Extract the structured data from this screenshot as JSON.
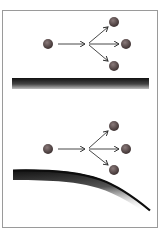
{
  "colors": {
    "frame_border": "#9a9a9a",
    "ball_light": "#8a7a7a",
    "ball_dark": "#3e3232",
    "arrow": "#333333",
    "surface": "#1a1a1a"
  },
  "panels": [
    {
      "name": "flat-surface-scattering",
      "incident_ball": {
        "cx": 48,
        "cy": 44
      },
      "split_point": {
        "x": 87,
        "y": 44
      },
      "scattered_balls": [
        {
          "cx": 114,
          "cy": 22
        },
        {
          "cx": 126,
          "cy": 44
        },
        {
          "cx": 114,
          "cy": 66
        }
      ],
      "surface": "flat"
    },
    {
      "name": "curved-surface-scattering",
      "incident_ball": {
        "cx": 48,
        "cy": 149
      },
      "split_point": {
        "x": 87,
        "y": 149
      },
      "scattered_balls": [
        {
          "cx": 114,
          "cy": 126
        },
        {
          "cx": 126,
          "cy": 149
        },
        {
          "cx": 114,
          "cy": 170
        }
      ],
      "surface": "curved"
    }
  ]
}
